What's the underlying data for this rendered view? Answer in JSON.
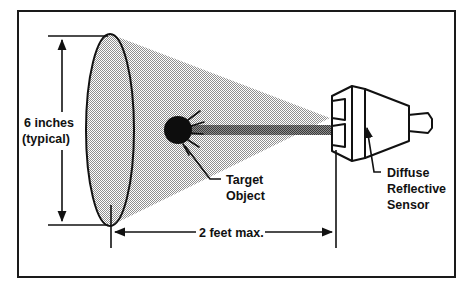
{
  "figure": {
    "background_color": "#ffffff",
    "frame": {
      "name": "figure-border",
      "x": 17,
      "y": 10,
      "width": 438,
      "height": 267,
      "stroke_color": "#1a1a1a",
      "stroke_width": 2,
      "fill": "none"
    }
  },
  "colors": {
    "ink": "#111111",
    "line": "#1a1a1a",
    "cone_fill": "#a9a9a9",
    "beam_fill": "#6e6e6e",
    "target_fill": "#0d0d0d",
    "sensor_face": "#ffffff",
    "sensor_side": "#ffffff",
    "white": "#ffffff"
  },
  "elements": {
    "cone": {
      "name": "sensing-field-cone",
      "description": "Gray conical sensing field widening from sensor to target plane",
      "apex_x": 330,
      "apex_y": 122,
      "base_center_x": 110,
      "base_center_y": 130,
      "base_rx": 24,
      "base_ry": 96,
      "fill": "#a9a9a9"
    },
    "beam": {
      "name": "light-beam",
      "description": "Dark gray emitted/received beam band between sensor and target object",
      "x1": 180,
      "x2": 332,
      "y": 130,
      "thickness": 9,
      "fill": "#6e6e6e"
    },
    "target": {
      "name": "target-object-dot",
      "description": "Black round target object intercepting the beam",
      "cx": 178,
      "cy": 130,
      "r": 14,
      "fill": "#0d0d0d",
      "sparkle_count": 5
    },
    "sensor": {
      "name": "diffuse-reflective-sensor-body",
      "description": "Isometric sensor housing with two lens apertures and rear connector stub",
      "front_face_x": 332,
      "front_face_y": 89,
      "lens_count": 2,
      "connector_label": "rear connector stub"
    }
  },
  "labels": {
    "height_dimension": {
      "name": "height-dimension-label",
      "line1": "6 inches",
      "line2": "(typical)",
      "x": 24,
      "y_line1": 124,
      "y_line2": 140,
      "font_size": 12.5,
      "arrow_x": 62,
      "arrow_top_y": 42,
      "arrow_bottom_y": 215
    },
    "distance_dimension": {
      "name": "distance-dimension-label",
      "text": "2 feet max.",
      "x": 230,
      "y": 236,
      "font_size": 12.5,
      "arrow_y": 232,
      "arrow_left_x": 111,
      "arrow_right_x": 336
    },
    "target_object": {
      "name": "target-object-label",
      "line1": "Target",
      "line2": "Object",
      "x": 223,
      "y_line1": 183,
      "y_line2": 199,
      "font_size": 12.5,
      "leader": "from dot at (186,145) down to (216,179)"
    },
    "sensor_label": {
      "name": "diffuse-reflective-sensor-label",
      "line1": "Diffuse",
      "line2": "Reflective",
      "line3": "Sensor",
      "x": 384,
      "y_line1": 176,
      "y_line2": 192,
      "y_line3": 208,
      "font_size": 12.5,
      "leader": "arrow from (375,172) up to (367,124) on sensor body"
    }
  }
}
